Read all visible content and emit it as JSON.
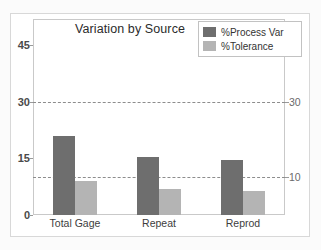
{
  "chart_data": {
    "type": "bar",
    "title": "Variation by Source",
    "xlabel": "",
    "ylabel": "",
    "categories": [
      "Total Gage",
      "Repeat",
      "Reprod"
    ],
    "series": [
      {
        "name": "%Process Var",
        "color": "#6e6e6e",
        "values": [
          21,
          15.5,
          14.5
        ]
      },
      {
        "name": "%Tolerance",
        "color": "#b4b4b4",
        "values": [
          9,
          7,
          6.5
        ]
      }
    ],
    "ylim": [
      0,
      52
    ],
    "yticks_left": [
      0,
      15,
      30,
      45
    ],
    "yticks_right": [
      10,
      30
    ],
    "gridlines": [
      10,
      30
    ],
    "grid": true,
    "legend_position": "top-right"
  },
  "axes": {
    "left_labels": [
      "45",
      "30",
      "15",
      "0"
    ],
    "right_labels": [
      "30",
      "10"
    ]
  },
  "legend": {
    "items": [
      {
        "label": "%Process Var"
      },
      {
        "label": "%Tolerance"
      }
    ]
  }
}
